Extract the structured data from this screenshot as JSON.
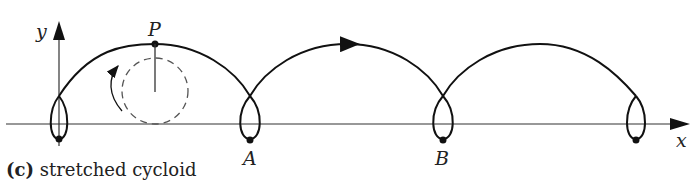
{
  "caption": {
    "tag": "(c)",
    "text": "stretched cycloid"
  },
  "labels": {
    "y_axis": "y",
    "x_axis": "x",
    "point_p": "P",
    "point_a": "A",
    "point_b": "B"
  },
  "colors": {
    "curve": "#111111",
    "axis": "#333333",
    "circle": "#555555"
  }
}
